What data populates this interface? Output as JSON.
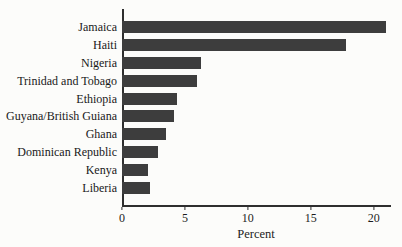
{
  "figure": {
    "background_color": "#fcfcfa",
    "bar_color": "#3d3d3d",
    "axis_color": "#2e2e2e",
    "text_color": "#1c1c1c"
  },
  "chart_data": {
    "type": "bar",
    "orientation": "horizontal",
    "title": "",
    "xlabel": "Percent",
    "ylabel": "",
    "categories": [
      "Jamaica",
      "Haiti",
      "Nigeria",
      "Trinidad and Tobago",
      "Ethiopia",
      "Guyana/British Guiana",
      "Ghana",
      "Dominican Republic",
      "Kenya",
      "Liberia"
    ],
    "values": [
      21.0,
      17.8,
      6.3,
      6.0,
      4.4,
      4.1,
      3.5,
      2.9,
      2.1,
      2.2
    ],
    "xticks": [
      0,
      5,
      10,
      15,
      20
    ],
    "xlim": [
      0,
      21.3
    ],
    "grid": false,
    "legend": "none"
  }
}
